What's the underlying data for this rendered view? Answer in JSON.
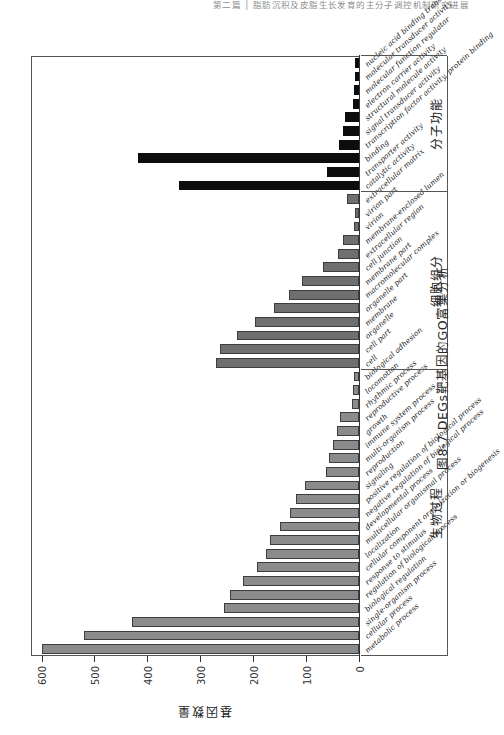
{
  "running_head": "第二篇 │ 脂肪沉积及皮脂生长发育的主分子调控机制研究进展",
  "caption": "图8-7  DEGs靶基因的GO富集分析",
  "axis": {
    "y_title": "基因数量",
    "y_ticks": [
      0,
      100,
      200,
      300,
      400,
      500,
      600
    ],
    "y_max": 620
  },
  "groups": [
    {
      "name": "生物过程",
      "key": "biological_process"
    },
    {
      "name": "细胞组分",
      "key": "cellular_component"
    },
    {
      "name": "分子功能",
      "key": "molecular_function"
    }
  ],
  "chart_data": {
    "type": "bar",
    "title": "图8-7  DEGs靶基因的GO富集分析",
    "xlabel": "",
    "ylabel": "基因数量",
    "ylim": [
      0,
      620
    ],
    "grid": false,
    "legend": "none",
    "orientation": "vertical",
    "group_labels_cn": [
      "生物过程",
      "细胞组分",
      "分子功能"
    ],
    "group_labels_en": [
      "Biological Process",
      "Cellular Component",
      "Molecular Function"
    ],
    "categories": [
      "metabolic process",
      "cellular process",
      "single-organism process",
      "biological regulation",
      "regulation of biological process",
      "response to stimulus",
      "cellular component organization or biogenesis",
      "localization",
      "multicellular organismal process",
      "developmental process",
      "negative regulation of biological process",
      "positive regulation of biological process",
      "signaling",
      "reproduction",
      "multi-organism process",
      "immune system process",
      "growth",
      "reproductive process",
      "rhythmic process",
      "locomotion",
      "biological adhesion",
      "cell",
      "cell part",
      "organelle",
      "membrane",
      "organelle part",
      "macromolecular complex",
      "membrane part",
      "cell junction",
      "extracellular region",
      "membrane-enclosed lumen",
      "virion",
      "virion part",
      "extracellular matrix",
      "catalytic activity",
      "transporter activity",
      "binding",
      "transcription factor activity, protein binding",
      "signal transducer activity",
      "structural molecule activity",
      "electron carrier activity",
      "molecular function regulator",
      "molecular transducer activity",
      "nucleic acid binding transcription factor activity"
    ],
    "values": [
      600,
      519,
      430,
      256,
      243,
      220,
      192,
      176,
      168,
      150,
      131,
      119,
      103,
      62,
      56,
      50,
      42,
      36,
      14,
      12,
      9,
      270,
      262,
      230,
      196,
      160,
      132,
      107,
      68,
      40,
      30,
      9,
      7,
      22,
      340,
      60,
      418,
      38,
      30,
      26,
      12,
      9,
      8,
      7
    ],
    "group_sizes": [
      21,
      13,
      10
    ],
    "series_colors": {
      "biological_process": "#8b8b8b",
      "cellular_component": "#6f6f6f",
      "molecular_function": "#0d0d0d"
    }
  }
}
